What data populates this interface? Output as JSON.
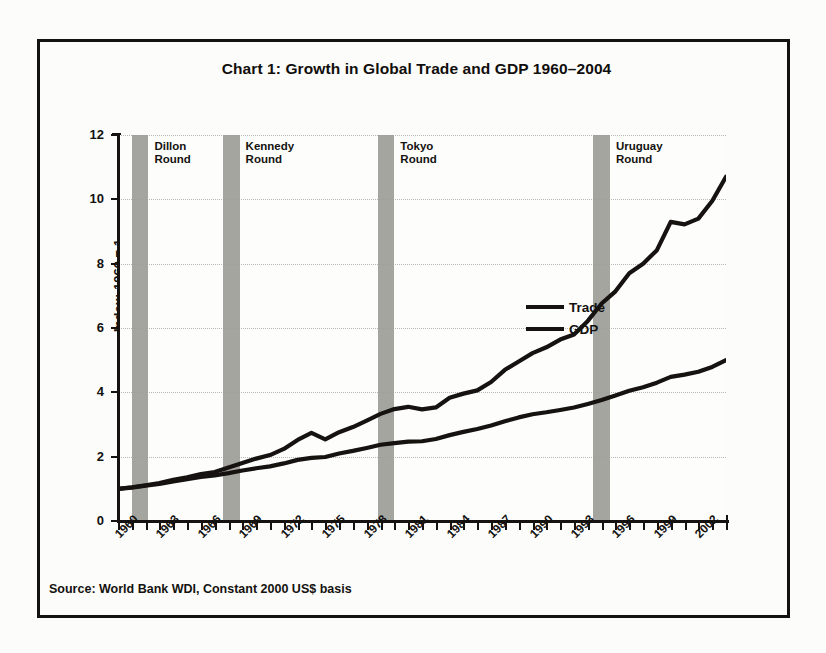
{
  "chart_data": {
    "type": "line",
    "title": "Chart 1: Growth in Global Trade and GDP 1960–2004",
    "xlabel": "",
    "ylabel": "Index: 1960 = 1",
    "source": "Source: World Bank WDI, Constant 2000 US$ basis",
    "grid": "horizontal dotted gridlines at every labelled y tick",
    "legend_position": "inside right-middle",
    "xlim": [
      1960,
      2004
    ],
    "ylim": [
      0,
      12
    ],
    "yticks": [
      "0",
      "2",
      "4",
      "6",
      "8",
      "10",
      "12"
    ],
    "ytick_values": [
      0,
      2,
      4,
      6,
      8,
      10,
      12
    ],
    "xticks": [
      "1960",
      "1963",
      "1966",
      "1969",
      "1972",
      "1975",
      "1978",
      "1981",
      "1984",
      "1987",
      "1990",
      "1993",
      "1996",
      "1999",
      "2002"
    ],
    "xtick_values": [
      1960,
      1963,
      1966,
      1969,
      1972,
      1975,
      1978,
      1981,
      1984,
      1987,
      1990,
      1993,
      1996,
      1999,
      2002
    ],
    "x": [
      1960,
      1961,
      1962,
      1963,
      1964,
      1965,
      1966,
      1967,
      1968,
      1969,
      1970,
      1971,
      1972,
      1973,
      1974,
      1975,
      1976,
      1977,
      1978,
      1979,
      1980,
      1981,
      1982,
      1983,
      1984,
      1985,
      1986,
      1987,
      1988,
      1989,
      1990,
      1991,
      1992,
      1993,
      1994,
      1995,
      1996,
      1997,
      1998,
      1999,
      2000,
      2001,
      2002,
      2003,
      2004
    ],
    "series": [
      {
        "name": "Trade",
        "color": "#15120f",
        "values": [
          1.0,
          1.05,
          1.11,
          1.18,
          1.28,
          1.36,
          1.46,
          1.52,
          1.66,
          1.8,
          1.94,
          2.05,
          2.24,
          2.52,
          2.74,
          2.54,
          2.76,
          2.92,
          3.12,
          3.33,
          3.48,
          3.55,
          3.47,
          3.53,
          3.83,
          3.96,
          4.06,
          4.32,
          4.7,
          4.96,
          5.22,
          5.4,
          5.64,
          5.8,
          6.22,
          6.76,
          7.14,
          7.7,
          8.0,
          8.42,
          9.3,
          9.22,
          9.4,
          9.95,
          10.7
        ]
      },
      {
        "name": "GDP",
        "color": "#15120f",
        "values": [
          1.0,
          1.04,
          1.1,
          1.15,
          1.23,
          1.3,
          1.37,
          1.42,
          1.49,
          1.57,
          1.64,
          1.7,
          1.79,
          1.9,
          1.96,
          1.99,
          2.1,
          2.18,
          2.27,
          2.37,
          2.42,
          2.47,
          2.48,
          2.55,
          2.67,
          2.77,
          2.86,
          2.97,
          3.1,
          3.22,
          3.32,
          3.38,
          3.45,
          3.53,
          3.64,
          3.76,
          3.9,
          4.05,
          4.16,
          4.3,
          4.48,
          4.55,
          4.64,
          4.79,
          5.0
        ]
      }
    ],
    "annotations": [
      {
        "label": "Dillon\nRound",
        "name": "dillon-round",
        "x_start": 1961.0,
        "x_end": 1962.2
      },
      {
        "label": "Kennedy\nRound",
        "name": "kennedy-round",
        "x_start": 1967.6,
        "x_end": 1968.8
      },
      {
        "label": "Tokyo\nRound",
        "name": "tokyo-round",
        "x_start": 1978.8,
        "x_end": 1980.0
      },
      {
        "label": "Uruguay\nRound",
        "name": "uruguay-round",
        "x_start": 1994.4,
        "x_end": 1995.6
      }
    ]
  }
}
